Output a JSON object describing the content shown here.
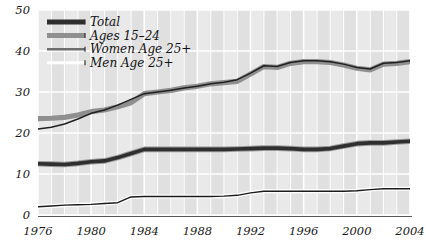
{
  "chart_data": {
    "type": "line",
    "title": "",
    "subtitle": "",
    "xlabel": "",
    "ylabel": "",
    "xlim": [
      1976,
      2004
    ],
    "ylim": [
      0,
      50
    ],
    "yticks": [
      0,
      10,
      20,
      30,
      40,
      50
    ],
    "xticks": [
      1976,
      1980,
      1984,
      1988,
      1992,
      1996,
      2000,
      2004
    ],
    "grid": "vertical-yearly-white-lines-and-horizontal-gridlines",
    "legend_position": "top-left-inside",
    "x": [
      1976,
      1977,
      1978,
      1979,
      1980,
      1981,
      1982,
      1983,
      1984,
      1985,
      1986,
      1987,
      1988,
      1989,
      1990,
      1991,
      1992,
      1993,
      1994,
      1995,
      1996,
      1997,
      1998,
      1999,
      2000,
      2001,
      2002,
      2003,
      2004
    ],
    "series": [
      {
        "name": "Total",
        "color": "#333333",
        "style": "thick-dark",
        "values": [
          12.5,
          12.4,
          12.3,
          12.6,
          13.0,
          13.2,
          14.0,
          15.0,
          16.0,
          16.0,
          16.0,
          16.0,
          16.0,
          16.0,
          16.0,
          16.1,
          16.2,
          16.3,
          16.3,
          16.2,
          16.0,
          16.0,
          16.2,
          16.8,
          17.4,
          17.6,
          17.6,
          17.8,
          18.0
        ]
      },
      {
        "name": "Ages 15-24",
        "color": "#8c8c8c",
        "style": "thick-gray",
        "values": [
          23.5,
          23.6,
          23.8,
          24.4,
          25.2,
          25.6,
          26.4,
          27.4,
          29.6,
          30.0,
          30.4,
          31.0,
          31.4,
          32.0,
          32.3,
          32.6,
          34.4,
          36.2,
          36.0,
          37.0,
          37.4,
          37.4,
          37.2,
          36.6,
          35.8,
          35.4,
          36.8,
          37.0,
          37.4
        ]
      },
      {
        "name": "Women Age 25+",
        "color": "#2b2b2b",
        "style": "thin-dark",
        "values": [
          21.0,
          21.4,
          22.2,
          23.4,
          24.8,
          25.6,
          26.8,
          28.2,
          29.6,
          30.0,
          30.4,
          31.0,
          31.4,
          32.0,
          32.4,
          33.0,
          34.6,
          36.4,
          36.2,
          37.2,
          37.6,
          37.6,
          37.4,
          36.8,
          36.0,
          35.6,
          37.0,
          37.2,
          37.6
        ]
      },
      {
        "name": "Men Age 25+",
        "color": "#1a1a1a",
        "style": "thin-white-halo",
        "values": [
          2.0,
          2.2,
          2.4,
          2.5,
          2.6,
          2.8,
          3.0,
          4.4,
          4.5,
          4.5,
          4.5,
          4.5,
          4.5,
          4.5,
          4.6,
          4.8,
          5.4,
          5.8,
          5.8,
          5.8,
          5.8,
          5.8,
          5.8,
          5.8,
          5.9,
          6.2,
          6.4,
          6.4,
          6.4
        ]
      }
    ],
    "legend": [
      {
        "label": "Total",
        "swatch": "thick-dark"
      },
      {
        "label": "Ages 15–24",
        "swatch": "thick-gray"
      },
      {
        "label": "Women Age 25+",
        "swatch": "thin-dark"
      },
      {
        "label": "Men Age 25+",
        "swatch": "thin-light"
      }
    ],
    "colors": {
      "plot_background": "#e2e2e2",
      "band_light": "#ebebeb",
      "gridline": "#ffffff",
      "axis": "#555555",
      "text": "#1a1a1a"
    }
  }
}
